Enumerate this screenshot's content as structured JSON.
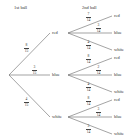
{
  "headers": {
    "first": "1st ball",
    "second": "2nd ball"
  },
  "first_level": [
    {
      "label": "red",
      "prob": {
        "num": "8",
        "den": "15"
      }
    },
    {
      "label": "blue",
      "prob": {
        "num": "3",
        "den": "15"
      }
    },
    {
      "label": "white",
      "prob": {
        "num": "4",
        "den": "15"
      }
    }
  ],
  "second_level": [
    [
      {
        "label": "red",
        "prob": {
          "num": "7",
          "den": "14"
        }
      },
      {
        "label": "blue",
        "prob": {
          "num": "3",
          "den": "14"
        }
      },
      {
        "label": "white",
        "prob": {
          "num": "4",
          "den": "14"
        }
      }
    ],
    [
      {
        "label": "red",
        "prob": {
          "num": "8",
          "den": "14"
        }
      },
      {
        "label": "blue",
        "prob": {
          "num": "2",
          "den": "14"
        }
      },
      {
        "label": "white",
        "prob": {
          "num": "4",
          "den": "14"
        }
      }
    ],
    [
      {
        "label": "red",
        "prob": {
          "num": "8",
          "den": "14"
        }
      },
      {
        "label": "blue",
        "prob": {
          "num": "3",
          "den": "14"
        }
      },
      {
        "label": "white",
        "prob": {
          "num": "3",
          "den": "14"
        }
      }
    ]
  ]
}
